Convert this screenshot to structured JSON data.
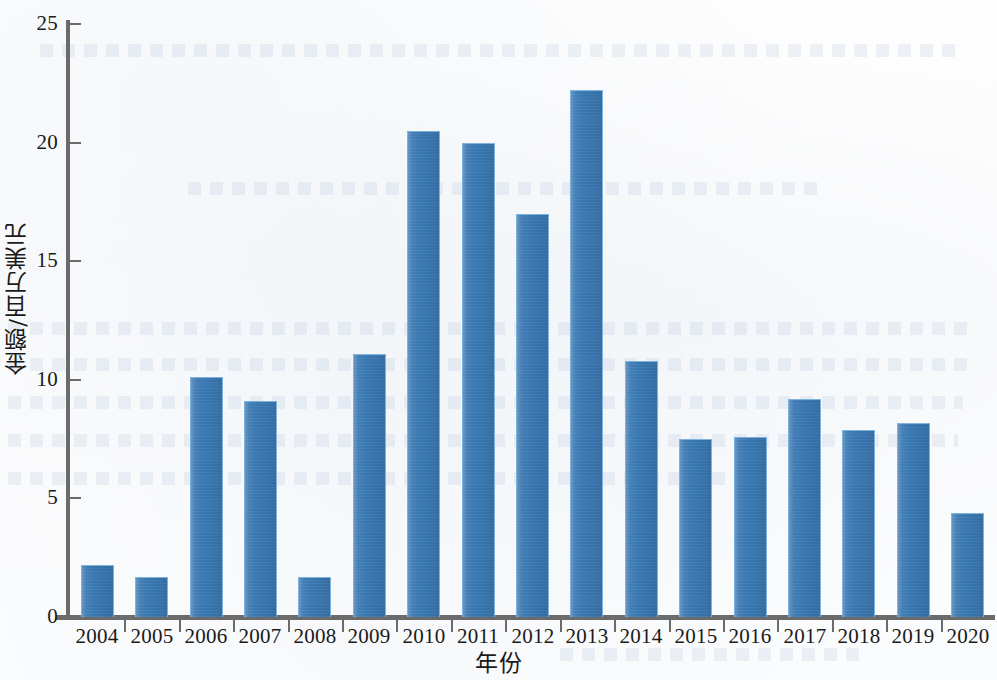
{
  "chart_data": {
    "type": "bar",
    "title": "",
    "subtitle": "",
    "xlabel": "年份",
    "ylabel": "金额/百万美元",
    "categories": [
      "2004",
      "2005",
      "2006",
      "2007",
      "2008",
      "2009",
      "2010",
      "2011",
      "2012",
      "2013",
      "2014",
      "2015",
      "2016",
      "2017",
      "2018",
      "2019",
      "2020"
    ],
    "values": [
      2.2,
      1.7,
      10.1,
      9.1,
      1.7,
      11.1,
      20.5,
      20.0,
      17.0,
      22.2,
      10.8,
      7.5,
      7.6,
      9.2,
      7.9,
      8.2,
      4.4
    ],
    "series": [
      {
        "name": "金额",
        "values": [
          2.2,
          1.7,
          10.1,
          9.1,
          1.7,
          11.1,
          20.5,
          20.0,
          17.0,
          22.2,
          10.8,
          7.5,
          7.6,
          9.2,
          7.9,
          8.2,
          4.4
        ]
      }
    ],
    "ylim": [
      0,
      25
    ],
    "y_ticks": [
      0,
      5,
      10,
      15,
      20,
      25
    ],
    "y_tick_labels": [
      "0",
      "5",
      "10",
      "15",
      "20",
      "25"
    ],
    "grid": false,
    "legend": false,
    "legend_position": "none",
    "bar_color": "#3a79b4",
    "bar_edge_color": "#7fb2dc",
    "axis_color": "#6b6b6b",
    "background_color": "#fdfdfd",
    "annotations": []
  }
}
